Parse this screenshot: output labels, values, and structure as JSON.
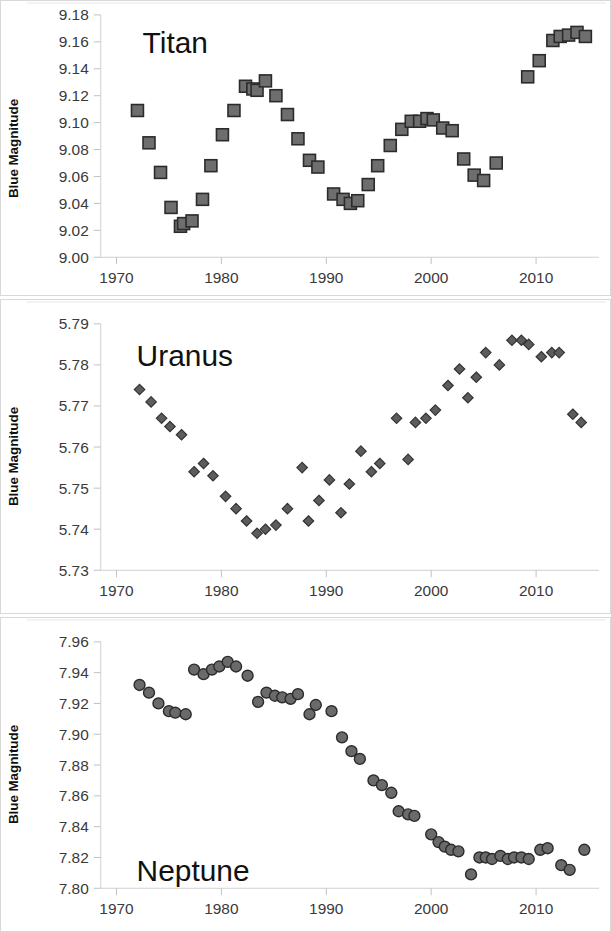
{
  "figure": {
    "panels": [
      "titan",
      "uranus",
      "neptune"
    ],
    "marker_fill": "#6e6e6e",
    "marker_stroke": "#2b2b2b"
  },
  "chart_data": [
    {
      "type": "scatter",
      "title": "Titan",
      "xlabel": "",
      "ylabel": "Blue Magnitude",
      "xlim": [
        1968.5,
        2016.0
      ],
      "ylim": [
        9.0,
        9.18
      ],
      "yticks": [
        "9.00",
        "9.02",
        "9.04",
        "9.06",
        "9.08",
        "9.10",
        "9.12",
        "9.14",
        "9.16",
        "9.18"
      ],
      "xticks": [
        "1970",
        "1980",
        "1990",
        "2000",
        "2010"
      ],
      "xtick_values": [
        1970,
        1980,
        1990,
        2000,
        2010
      ],
      "grid": false,
      "legend": "none",
      "marker": "square",
      "x": [
        1972.0,
        1973.1,
        1974.2,
        1975.2,
        1976.1,
        1976.4,
        1977.2,
        1978.2,
        1979.0,
        1980.1,
        1981.2,
        1982.3,
        1983.0,
        1983.4,
        1984.2,
        1985.2,
        1986.3,
        1987.3,
        1988.4,
        1989.2,
        1990.7,
        1991.6,
        1992.3,
        1993.0,
        1994.0,
        1994.9,
        1996.1,
        1997.2,
        1998.1,
        1998.9,
        1999.6,
        2000.2,
        2001.1,
        2002.0,
        2003.1,
        2004.1,
        2005.0,
        2006.2,
        2009.2,
        2010.3,
        2011.6,
        2012.3,
        2013.1,
        2013.9,
        2014.7
      ],
      "y": [
        9.109,
        9.085,
        9.063,
        9.037,
        9.023,
        9.025,
        9.027,
        9.043,
        9.068,
        9.091,
        9.109,
        9.127,
        9.125,
        9.124,
        9.131,
        9.12,
        9.106,
        9.088,
        9.072,
        9.067,
        9.047,
        9.043,
        9.04,
        9.042,
        9.054,
        9.068,
        9.083,
        9.095,
        9.101,
        9.101,
        9.103,
        9.102,
        9.096,
        9.094,
        9.073,
        9.061,
        9.057,
        9.07,
        9.134,
        9.146,
        9.161,
        9.164,
        9.165,
        9.167,
        9.164
      ]
    },
    {
      "type": "scatter",
      "title": "Uranus",
      "xlabel": "",
      "ylabel": "Blue Magnitude",
      "xlim": [
        1968.5,
        2016.0
      ],
      "ylim": [
        5.73,
        5.79
      ],
      "yticks": [
        "5.73",
        "5.74",
        "5.75",
        "5.76",
        "5.77",
        "5.78",
        "5.79"
      ],
      "xticks": [
        "1970",
        "1980",
        "1990",
        "2000",
        "2010"
      ],
      "xtick_values": [
        1970,
        1980,
        1990,
        2000,
        2010
      ],
      "grid": false,
      "legend": "none",
      "marker": "diamond",
      "x": [
        1972.2,
        1973.3,
        1974.3,
        1975.1,
        1976.2,
        1977.4,
        1978.3,
        1979.2,
        1980.4,
        1981.4,
        1982.4,
        1983.4,
        1984.2,
        1985.2,
        1986.3,
        1987.7,
        1988.3,
        1989.3,
        1990.3,
        1991.4,
        1992.2,
        1993.3,
        1994.3,
        1995.1,
        1996.7,
        1997.8,
        1998.5,
        1999.5,
        2000.4,
        2001.6,
        2002.7,
        2003.5,
        2004.3,
        2005.2,
        2006.5,
        2007.7,
        2008.6,
        2009.3,
        2010.5,
        2011.5,
        2012.2,
        2013.5,
        2014.3
      ],
      "y": [
        5.774,
        5.771,
        5.767,
        5.765,
        5.763,
        5.754,
        5.756,
        5.753,
        5.748,
        5.745,
        5.742,
        5.739,
        5.74,
        5.741,
        5.745,
        5.755,
        5.742,
        5.747,
        5.752,
        5.744,
        5.751,
        5.759,
        5.754,
        5.756,
        5.767,
        5.757,
        5.766,
        5.767,
        5.769,
        5.775,
        5.779,
        5.772,
        5.777,
        5.783,
        5.78,
        5.786,
        5.786,
        5.785,
        5.782,
        5.783,
        5.783,
        5.768,
        5.766
      ]
    },
    {
      "type": "scatter",
      "title": "Neptune",
      "xlabel": "",
      "ylabel": "Blue Magnitude",
      "xlim": [
        1968.5,
        2016.0
      ],
      "ylim": [
        7.8,
        7.96
      ],
      "yticks": [
        "7.80",
        "7.82",
        "7.84",
        "7.86",
        "7.88",
        "7.90",
        "7.92",
        "7.94",
        "7.96"
      ],
      "xticks": [
        "1970",
        "1980",
        "1990",
        "2000",
        "2010"
      ],
      "xtick_values": [
        1970,
        1980,
        1990,
        2000,
        2010
      ],
      "grid": false,
      "legend": "none",
      "marker": "circle",
      "x": [
        1972.2,
        1973.1,
        1974.0,
        1975.0,
        1975.6,
        1976.6,
        1977.4,
        1978.3,
        1979.1,
        1979.8,
        1980.6,
        1981.4,
        1982.5,
        1983.5,
        1984.3,
        1985.1,
        1985.8,
        1986.6,
        1987.3,
        1988.4,
        1989.0,
        1990.5,
        1991.5,
        1992.4,
        1993.2,
        1994.5,
        1995.3,
        1996.2,
        1996.9,
        1997.8,
        1998.4,
        2000.0,
        2000.7,
        2001.3,
        2001.9,
        2002.6,
        2003.8,
        2004.6,
        2005.2,
        2005.8,
        2006.6,
        2007.3,
        2007.9,
        2008.6,
        2009.3,
        2010.4,
        2011.1,
        2012.4,
        2013.2,
        2014.6
      ],
      "y": [
        7.932,
        7.927,
        7.92,
        7.915,
        7.914,
        7.913,
        7.942,
        7.939,
        7.942,
        7.944,
        7.947,
        7.944,
        7.938,
        7.921,
        7.927,
        7.925,
        7.924,
        7.923,
        7.926,
        7.913,
        7.919,
        7.915,
        7.898,
        7.889,
        7.884,
        7.87,
        7.867,
        7.862,
        7.85,
        7.848,
        7.847,
        7.835,
        7.83,
        7.827,
        7.825,
        7.824,
        7.809,
        7.82,
        7.82,
        7.819,
        7.821,
        7.819,
        7.82,
        7.82,
        7.819,
        7.825,
        7.826,
        7.815,
        7.812,
        7.825
      ]
    }
  ]
}
